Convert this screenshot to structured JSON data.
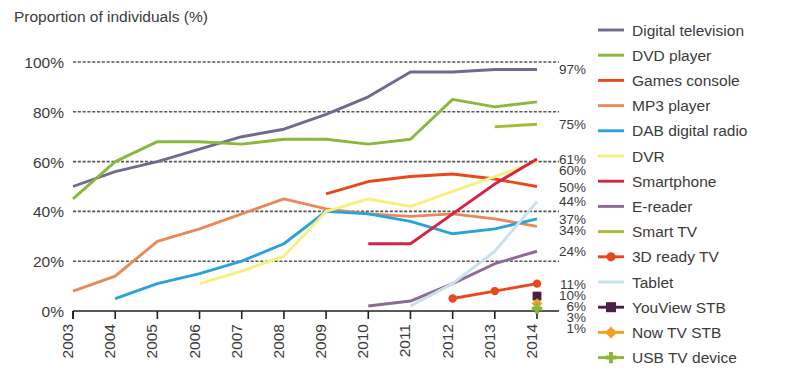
{
  "chart_data": {
    "type": "line",
    "title": "Proportion of individuals (%)",
    "xlabel": "",
    "ylabel": "Proportion of individuals (%)",
    "ylim": [
      0,
      100
    ],
    "ytick_labels": [
      "0%",
      "20%",
      "40%",
      "60%",
      "80%",
      "100%"
    ],
    "ytick_values": [
      0,
      20,
      40,
      60,
      80,
      100
    ],
    "grid": true,
    "legend_position": "right",
    "categories": [
      "2003",
      "2004",
      "2005",
      "2006",
      "2007",
      "2008",
      "2009",
      "2010",
      "2011",
      "2012",
      "2013",
      "2014"
    ],
    "x": [
      2003,
      2004,
      2005,
      2006,
      2007,
      2008,
      2009,
      2010,
      2011,
      2012,
      2013,
      2014
    ],
    "series": [
      {
        "name": "Digital television",
        "color": "#6e6b91",
        "marker": "none",
        "end_label": "97%",
        "values": [
          50,
          56,
          60,
          65,
          70,
          73,
          79,
          86,
          96,
          96,
          97,
          97
        ]
      },
      {
        "name": "DVD player",
        "color": "#8cb73e",
        "marker": "none",
        "end_label": "75%",
        "values": [
          45,
          60,
          68,
          68,
          67,
          69,
          69,
          67,
          69,
          85,
          82,
          84
        ]
      },
      {
        "name": "Games console",
        "color": "#e8481c",
        "marker": "none",
        "end_label": "50%",
        "values": [
          null,
          null,
          null,
          null,
          null,
          null,
          47,
          52,
          54,
          55,
          53,
          50
        ]
      },
      {
        "name": "MP3 player",
        "color": "#e8895c",
        "marker": "none",
        "end_label": "34%",
        "values": [
          8,
          14,
          28,
          33,
          39,
          45,
          41,
          39,
          38,
          39,
          37,
          34
        ]
      },
      {
        "name": "DAB digital radio",
        "color": "#29a3dc",
        "marker": "none",
        "end_label": "37%",
        "values": [
          null,
          5,
          11,
          15,
          20,
          27,
          40,
          39,
          36,
          31,
          33,
          37
        ]
      },
      {
        "name": "DVR",
        "color": "#f7f07e",
        "marker": "none",
        "end_label": "60%",
        "values": [
          null,
          null,
          null,
          11,
          16,
          22,
          40,
          45,
          42,
          48,
          54,
          60
        ]
      },
      {
        "name": "Smartphone",
        "color": "#d42546",
        "marker": "none",
        "end_label": "61%",
        "values": [
          null,
          null,
          null,
          null,
          null,
          null,
          null,
          27,
          27,
          39,
          51,
          61
        ]
      },
      {
        "name": "E-reader",
        "color": "#8b6b94",
        "marker": "none",
        "end_label": "24%",
        "values": [
          null,
          null,
          null,
          null,
          null,
          null,
          null,
          2,
          4,
          11,
          19,
          24
        ]
      },
      {
        "name": "Smart TV",
        "color": "#a4bc3c",
        "marker": "none",
        "end_label": "75%",
        "values": [
          null,
          null,
          null,
          null,
          null,
          null,
          null,
          null,
          null,
          null,
          74,
          75
        ]
      },
      {
        "name": "3D ready TV",
        "color": "#e8481c",
        "marker": "circle",
        "end_label": "11%",
        "values": [
          null,
          null,
          null,
          null,
          null,
          null,
          null,
          null,
          null,
          5,
          8,
          11
        ]
      },
      {
        "name": "Tablet",
        "color": "#c8e1ea",
        "marker": "none",
        "end_label": "44%",
        "values": [
          null,
          null,
          null,
          null,
          null,
          null,
          null,
          null,
          2,
          11,
          24,
          44
        ]
      },
      {
        "name": "YouView STB",
        "color": "#4a1f45",
        "marker": "square",
        "end_label": "6%",
        "values": [
          null,
          null,
          null,
          null,
          null,
          null,
          null,
          null,
          null,
          null,
          null,
          6
        ]
      },
      {
        "name": "Now TV STB",
        "color": "#f3a11c",
        "marker": "diamond",
        "end_label": "3%",
        "values": [
          null,
          null,
          null,
          null,
          null,
          null,
          null,
          null,
          null,
          null,
          null,
          3
        ]
      },
      {
        "name": "USB TV device",
        "color": "#8cb73e",
        "marker": "cross",
        "end_label": "1%",
        "values": [
          null,
          null,
          null,
          null,
          null,
          null,
          null,
          null,
          null,
          null,
          null,
          1
        ]
      }
    ],
    "end_labels": [
      {
        "text": "97%",
        "value": 97
      },
      {
        "text": "75%",
        "value": 75
      },
      {
        "text": "61%",
        "value": 61
      },
      {
        "text": "60%",
        "value": 60
      },
      {
        "text": "50%",
        "value": 50
      },
      {
        "text": "44%",
        "value": 44
      },
      {
        "text": "37%",
        "value": 37
      },
      {
        "text": "34%",
        "value": 34
      },
      {
        "text": "24%",
        "value": 24
      },
      {
        "text": "11%",
        "value": 11
      },
      {
        "text": "10%",
        "value": 10
      },
      {
        "text": "6%",
        "value": 6
      },
      {
        "text": "3%",
        "value": 3
      },
      {
        "text": "1%",
        "value": 1
      }
    ]
  }
}
